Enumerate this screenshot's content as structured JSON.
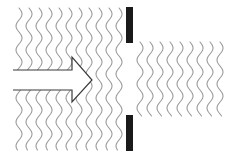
{
  "diagram": {
    "title": "Wave diffraction through a single slit",
    "colors": {
      "background": "#ffffff",
      "wave": "#9a9a9a",
      "barrier": "#1a1a1a",
      "arrow_stroke": "#3a3a3a",
      "arrow_fill": "#ffffff"
    },
    "incident_waves": {
      "count": 11,
      "x_start": 19,
      "spacing": 10,
      "y_top": 8,
      "y_bottom": 150,
      "amplitude": 3,
      "wavelength": 24
    },
    "transmitted_waves": {
      "count": 9,
      "x_start": 140,
      "spacing": 10,
      "y_top": 42,
      "y_bottom": 116,
      "amplitude": 3,
      "wavelength": 24
    },
    "barrier": {
      "x": 126,
      "width": 7,
      "top_segment": {
        "y": 7,
        "height": 36
      },
      "bottom_segment": {
        "y": 115,
        "height": 36
      },
      "slit": {
        "y_top": 43,
        "y_bottom": 115
      }
    },
    "arrow": {
      "label": "direction of wave propagation",
      "shaft_x_start": 13,
      "shaft_x_end": 72,
      "shaft_y_top": 70,
      "shaft_y_bottom": 90,
      "head_y_top": 57,
      "head_y_bottom": 102,
      "tip_x": 92,
      "tip_y": 80
    }
  }
}
